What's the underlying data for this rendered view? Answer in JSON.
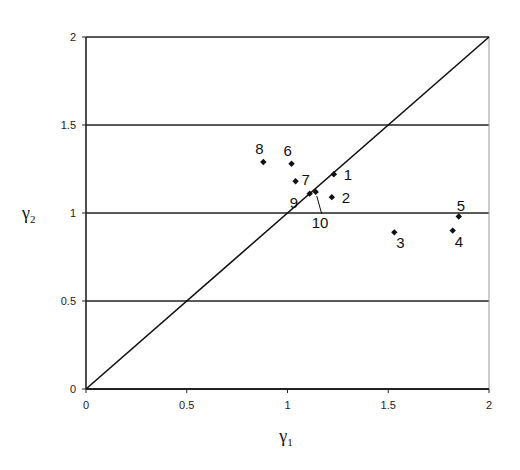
{
  "chart_data": {
    "type": "scatter",
    "title": "",
    "xlabel": "γ1",
    "ylabel": "γ2",
    "xlim": [
      0,
      2
    ],
    "ylim": [
      0,
      2
    ],
    "xticks": [
      "0",
      "0.5",
      "1",
      "1.5",
      "2"
    ],
    "yticks": [
      "0",
      "0.5",
      "1",
      "1.5",
      "2"
    ],
    "grid": "horizontal",
    "reference_line": {
      "name": "y = x",
      "from": [
        0,
        0
      ],
      "to": [
        2,
        2
      ]
    },
    "points": [
      {
        "label": "1",
        "x": 1.23,
        "y": 1.22
      },
      {
        "label": "2",
        "x": 1.22,
        "y": 1.09
      },
      {
        "label": "3",
        "x": 1.53,
        "y": 0.89
      },
      {
        "label": "4",
        "x": 1.82,
        "y": 0.9
      },
      {
        "label": "5",
        "x": 1.85,
        "y": 0.98
      },
      {
        "label": "6",
        "x": 1.02,
        "y": 1.28
      },
      {
        "label": "7",
        "x": 1.04,
        "y": 1.18
      },
      {
        "label": "8",
        "x": 0.88,
        "y": 1.29
      },
      {
        "label": "9",
        "x": 1.11,
        "y": 1.11
      },
      {
        "label": "10",
        "x": 1.14,
        "y": 1.12
      }
    ]
  },
  "axes": {
    "x_label_main": "γ",
    "x_label_sub": "1",
    "y_label_main": "γ",
    "y_label_sub": "2"
  }
}
